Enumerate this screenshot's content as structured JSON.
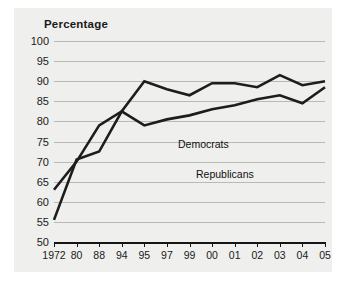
{
  "chart_data": {
    "type": "line",
    "title": "Percentage",
    "xlabel": "",
    "ylabel": "",
    "categories": [
      "1972",
      "80",
      "88",
      "94",
      "95",
      "97",
      "99",
      "00",
      "01",
      "02",
      "03",
      "04",
      "05"
    ],
    "ylim": [
      50,
      100
    ],
    "yticks": [
      100,
      95,
      90,
      85,
      80,
      75,
      70,
      65,
      60,
      55,
      50
    ],
    "grid": true,
    "legend_position": "inline-labels",
    "series": [
      {
        "name": "Democrats",
        "values": [
          63,
          70,
          79,
          82.5,
          90,
          88,
          86.5,
          89.5,
          89.5,
          88.5,
          91.5,
          89,
          90
        ]
      },
      {
        "name": "Republicans",
        "values": [
          55.5,
          70.5,
          72.5,
          82.5,
          79,
          80.5,
          81.5,
          83,
          84,
          85.5,
          86.5,
          84.5,
          88.5
        ]
      }
    ],
    "annotations": [
      {
        "text": "Democrats",
        "series": "Democrats"
      },
      {
        "text": "Republicans",
        "series": "Republicans"
      }
    ],
    "colors": {
      "line": "#1d1d1d",
      "grid": "#b9b9b6",
      "axis": "#151515",
      "plot_background": "#efefed",
      "figure_background": "#ffffff",
      "text": "#1a1a1a"
    }
  }
}
